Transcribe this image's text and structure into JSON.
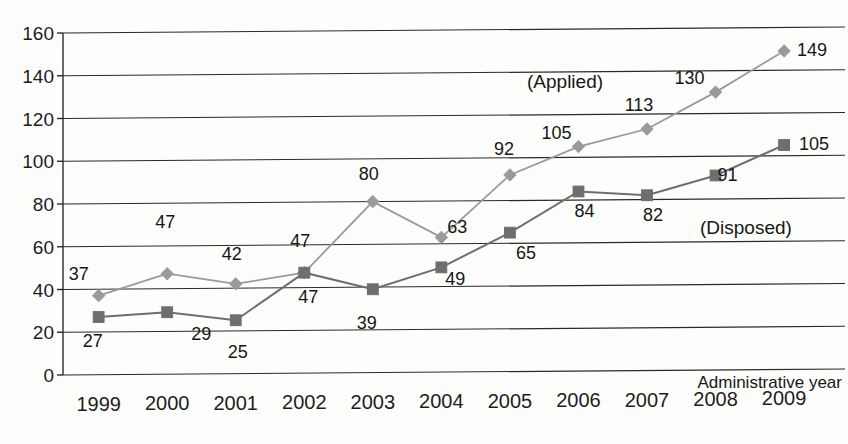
{
  "chart_data": {
    "type": "line",
    "title": "",
    "xlabel": "Administrative year",
    "ylabel": "",
    "ylim": [
      0,
      160
    ],
    "yticks": [
      0,
      20,
      40,
      60,
      80,
      100,
      120,
      140,
      160
    ],
    "grid": true,
    "legend_position": "inline-annotation",
    "categories": [
      "1999",
      "2000",
      "2001",
      "2002",
      "2003",
      "2004",
      "2005",
      "2006",
      "2007",
      "2008",
      "2009"
    ],
    "series": [
      {
        "name": "(Applied)",
        "marker": "diamond",
        "color": "#9a9a9a",
        "values": [
          37,
          47,
          42,
          47,
          80,
          63,
          92,
          105,
          113,
          130,
          149
        ],
        "point_labels": [
          "37",
          "47",
          "42",
          "47",
          "80",
          "63",
          "92",
          "105",
          "113",
          "130",
          "149"
        ]
      },
      {
        "name": "(Disposed)",
        "marker": "square",
        "color": "#6e6e6e",
        "values": [
          27,
          29,
          25,
          47,
          39,
          49,
          65,
          84,
          82,
          91,
          105
        ],
        "point_labels": [
          "27",
          "29",
          "25",
          "47",
          "39",
          "49",
          "65",
          "84",
          "82",
          "91",
          "105"
        ]
      }
    ]
  },
  "annotations": {
    "applied_label": "(Applied)",
    "disposed_label": "(Disposed)",
    "x_axis_title": "Administrative year"
  }
}
